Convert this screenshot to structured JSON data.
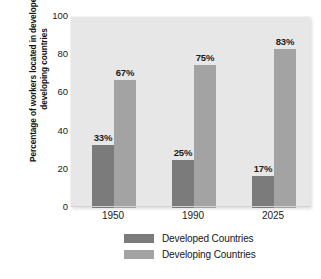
{
  "chart_data": {
    "type": "bar",
    "title": "",
    "subtitle": "",
    "xlabel": "",
    "ylabel": "Percentage of workers located in developed and developing countries",
    "categories": [
      "1950",
      "1990",
      "2025"
    ],
    "series": [
      {
        "name": "Developed Countries",
        "color": "#7b7b7b",
        "values": [
          33,
          25,
          17
        ],
        "labels": [
          "33%",
          "25%",
          "17%"
        ]
      },
      {
        "name": "Developing Countries",
        "color": "#a3a3a3",
        "values": [
          67,
          75,
          83
        ],
        "labels": [
          "67%",
          "75%",
          "83%"
        ]
      }
    ],
    "ylim": [
      0,
      100
    ],
    "yticks": [
      "0",
      "20",
      "40",
      "60",
      "80",
      "100"
    ],
    "ytick_values": [
      0,
      20,
      40,
      60,
      80,
      100
    ],
    "grid": false,
    "legend_position": "bottom-center",
    "plot_background": "#e7e7e7",
    "figure_background": "#ffffff"
  },
  "legend": {
    "items": [
      {
        "label": "Developed Countries"
      },
      {
        "label": "Developing Countries"
      }
    ]
  }
}
